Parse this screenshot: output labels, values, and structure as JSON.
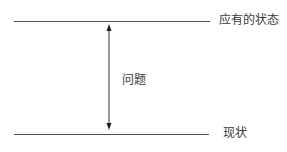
{
  "diagram": {
    "top_label": "应有的状态",
    "gap_label": "问题",
    "bottom_label": "现状",
    "line_color": "#555555",
    "arrow_color": "#333333"
  }
}
